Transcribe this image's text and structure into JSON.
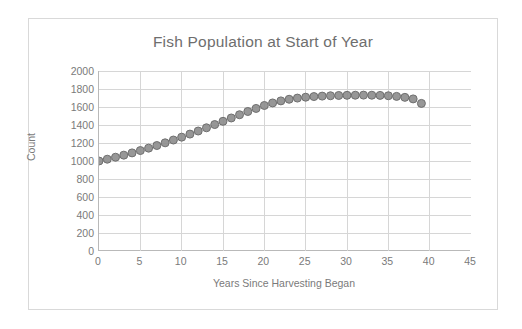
{
  "chart_data": {
    "type": "scatter",
    "title": "Fish Population at Start of Year",
    "xlabel": "Years Since Harvesting Began",
    "ylabel": "Count",
    "xlim": [
      0,
      45
    ],
    "ylim": [
      0,
      2000
    ],
    "xticks": [
      0,
      5,
      10,
      15,
      20,
      25,
      30,
      35,
      40,
      45
    ],
    "yticks": [
      0,
      200,
      400,
      600,
      800,
      1000,
      1200,
      1400,
      1600,
      1800,
      2000
    ],
    "grid": true,
    "legend": false,
    "marker_color": "#8c8c8c",
    "marker_edge_color": "#6f6f6f",
    "series": [
      {
        "name": "Fish Population",
        "x": [
          0,
          1,
          2,
          3,
          4,
          5,
          6,
          7,
          8,
          9,
          10,
          11,
          12,
          13,
          14,
          15,
          16,
          17,
          18,
          19,
          20,
          21,
          22,
          23,
          24,
          25,
          26,
          27,
          28,
          29,
          30,
          31,
          32,
          33,
          34,
          35,
          36,
          37,
          38,
          39
        ],
        "values": [
          1000,
          1020,
          1042,
          1065,
          1090,
          1116,
          1143,
          1172,
          1202,
          1233,
          1265,
          1299,
          1333,
          1369,
          1405,
          1441,
          1478,
          1514,
          1550,
          1584,
          1617,
          1645,
          1668,
          1686,
          1699,
          1709,
          1716,
          1721,
          1725,
          1728,
          1730,
          1731,
          1732,
          1731,
          1729,
          1725,
          1718,
          1707,
          1690,
          1640
        ]
      }
    ]
  },
  "axes": {
    "ytick_labels": [
      "2000",
      "1800",
      "1600",
      "1400",
      "1200",
      "1000",
      "800",
      "600",
      "400",
      "200",
      "0"
    ],
    "xtick_labels": [
      "0",
      "5",
      "10",
      "15",
      "20",
      "25",
      "30",
      "35",
      "40",
      "45"
    ]
  }
}
